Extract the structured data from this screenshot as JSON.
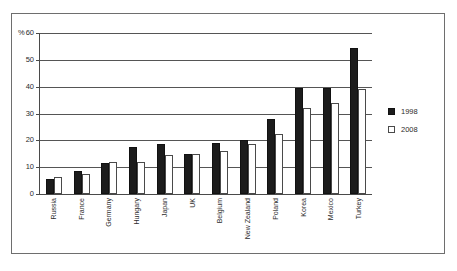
{
  "chart_data": {
    "type": "bar",
    "title": "",
    "xlabel": "",
    "ylabel": "%",
    "unit_symbol": "%",
    "ylim": [
      0,
      60
    ],
    "yticks": [
      0,
      10,
      20,
      30,
      40,
      50,
      60
    ],
    "ytick_labels": [
      "0",
      "10",
      "20",
      "30",
      "40",
      "50",
      "60"
    ],
    "grid": true,
    "legend_position": "right",
    "categories": [
      "Russia",
      "France",
      "Germany",
      "Hungary",
      "Japan",
      "UK",
      "Belgium",
      "New Zealand",
      "Poland",
      "Korea",
      "Mexico",
      "Turkey"
    ],
    "series": [
      {
        "name": "1998",
        "color": "#1c1c1c",
        "values": [
          5.5,
          8.5,
          11.5,
          17.5,
          18.5,
          15,
          19,
          20,
          28,
          39.5,
          39.5,
          54.5
        ]
      },
      {
        "name": "2008",
        "color": "#ffffff",
        "values": [
          6.5,
          7.5,
          12,
          12,
          14.5,
          15,
          16,
          18.5,
          22.5,
          32,
          34,
          39
        ]
      }
    ]
  },
  "legend": {
    "entries": [
      {
        "label": "1998",
        "swatch": "filled-black-square"
      },
      {
        "label": "2008",
        "swatch": "outlined-white-square"
      }
    ]
  },
  "axis": {
    "percent_sign": "%"
  }
}
